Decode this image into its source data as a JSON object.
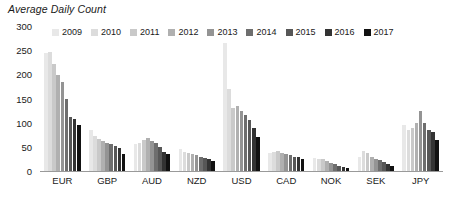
{
  "chart_data": {
    "type": "bar",
    "title": "Average Daily Count",
    "xlabel": "",
    "ylabel": "",
    "ylim": [
      0,
      300
    ],
    "yticks": [
      300,
      250,
      200,
      150,
      100,
      50,
      0
    ],
    "grid": false,
    "legend_position": "top",
    "categories": [
      "EUR",
      "GBP",
      "AUD",
      "NZD",
      "USD",
      "CAD",
      "NOK",
      "SEK",
      "JPY"
    ],
    "series": [
      {
        "name": "2009",
        "color": "#e8e8e8",
        "values": [
          245,
          85,
          55,
          46,
          265,
          38,
          27,
          30,
          95
        ]
      },
      {
        "name": "2010",
        "color": "#dcdcdc",
        "values": [
          247,
          72,
          58,
          40,
          170,
          40,
          25,
          42,
          85
        ]
      },
      {
        "name": "2011",
        "color": "#c9c9c9",
        "values": [
          222,
          66,
          65,
          38,
          130,
          42,
          24,
          38,
          90
        ]
      },
      {
        "name": "2012",
        "color": "#b0b0b0",
        "values": [
          198,
          62,
          68,
          36,
          135,
          38,
          20,
          30,
          100
        ]
      },
      {
        "name": "2013",
        "color": "#949494",
        "values": [
          185,
          58,
          62,
          33,
          125,
          36,
          17,
          25,
          125
        ]
      },
      {
        "name": "2014",
        "color": "#6e6e6e",
        "values": [
          148,
          56,
          57,
          30,
          115,
          33,
          14,
          22,
          100
        ]
      },
      {
        "name": "2015",
        "color": "#575757",
        "values": [
          112,
          52,
          50,
          27,
          105,
          30,
          11,
          18,
          85
        ]
      },
      {
        "name": "2016",
        "color": "#333333",
        "values": [
          108,
          48,
          40,
          24,
          90,
          28,
          8,
          14,
          80
        ]
      },
      {
        "name": "2017",
        "color": "#111111",
        "values": [
          95,
          36,
          35,
          20,
          70,
          24,
          6,
          10,
          65
        ]
      }
    ]
  },
  "axis": {
    "ytick_labels": [
      "300",
      "250",
      "200",
      "150",
      "100",
      "50",
      "0"
    ]
  }
}
